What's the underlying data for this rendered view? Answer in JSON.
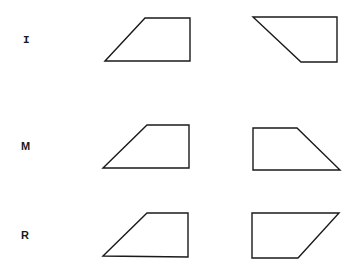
{
  "rows": [
    {
      "label": "I",
      "label_pos": {
        "x": 23,
        "y": 35
      },
      "label_style": "serif",
      "shapes": [
        {
          "name": "row-i-left-trapezoid",
          "points": "105,61 145,18 190,18 190,61"
        },
        {
          "name": "row-i-right-trapezoid",
          "points": "253,17 337,17 337,62 301,62"
        }
      ]
    },
    {
      "label": "M",
      "label_pos": {
        "x": 21,
        "y": 141
      },
      "label_style": "sans",
      "shapes": [
        {
          "name": "row-m-left-trapezoid",
          "points": "103,168 147,125 189,125 189,168"
        },
        {
          "name": "row-m-right-trapezoid",
          "points": "253,128 297,128 340,170 253,170"
        }
      ]
    },
    {
      "label": "R",
      "label_pos": {
        "x": 21,
        "y": 230
      },
      "label_style": "sans",
      "shapes": [
        {
          "name": "row-r-left-trapezoid",
          "points": "103,256 147,213 188,213 188,257"
        },
        {
          "name": "row-r-right-trapezoid",
          "points": "252,213 339,213 298,258 252,258"
        }
      ]
    }
  ],
  "colors": {
    "stroke": "#1a1a1a",
    "background": "#ffffff"
  }
}
